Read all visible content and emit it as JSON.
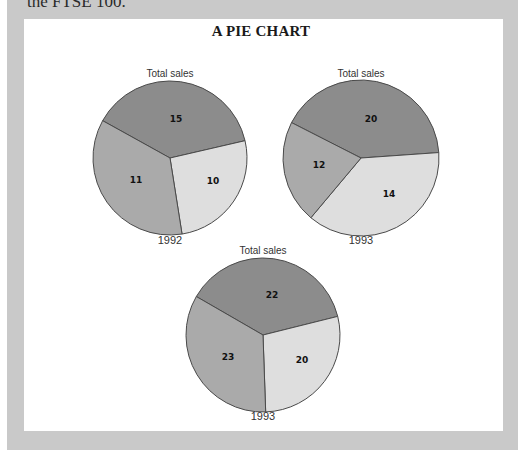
{
  "page": {
    "top_text": "the FTSE 100.",
    "background_color": "#c9c9c9",
    "panel_color": "#ffffff"
  },
  "title": "A PIE CHART",
  "colors": {
    "dark": "#8c8c8c",
    "medium": "#aaaaaa",
    "light": "#dedede",
    "outline": "#4a4a4a"
  },
  "chart_data": [
    {
      "type": "pie",
      "title": "Total sales",
      "label": "1992",
      "slices": [
        {
          "value": 15,
          "shade": "dark"
        },
        {
          "value": 10,
          "shade": "light"
        },
        {
          "value": 11,
          "shade": "medium"
        }
      ],
      "layout": {
        "cx": 170,
        "cy": 158,
        "r": 77,
        "angles": [
          299,
          437,
          77,
          171
        ],
        "label_pos": [
          [
            176,
            122
          ],
          [
            213,
            184
          ],
          [
            136,
            183
          ]
        ],
        "title_y": 77,
        "year_y": 244
      }
    },
    {
      "type": "pie",
      "title": "Total sales",
      "label": "1993",
      "slices": [
        {
          "value": 20,
          "shade": "dark"
        },
        {
          "value": 14,
          "shade": "light"
        },
        {
          "value": 12,
          "shade": "medium"
        }
      ],
      "layout": {
        "cx": 361,
        "cy": 158,
        "r": 78,
        "angles": [
          297,
          446,
          86,
          220
        ],
        "label_pos": [
          [
            371,
            122
          ],
          [
            389,
            197
          ],
          [
            319,
            168
          ]
        ],
        "title_y": 77,
        "year_y": 244
      }
    },
    {
      "type": "pie",
      "title": "Total sales",
      "label": "1993",
      "slices": [
        {
          "value": 22,
          "shade": "dark"
        },
        {
          "value": 20,
          "shade": "light"
        },
        {
          "value": 23,
          "shade": "medium"
        }
      ],
      "layout": {
        "cx": 263,
        "cy": 335,
        "r": 77,
        "angles": [
          300,
          436,
          76,
          178
        ],
        "label_pos": [
          [
            272,
            298
          ],
          [
            302,
            363
          ],
          [
            228,
            360
          ]
        ],
        "title_y": 254,
        "year_y": 420
      }
    }
  ]
}
